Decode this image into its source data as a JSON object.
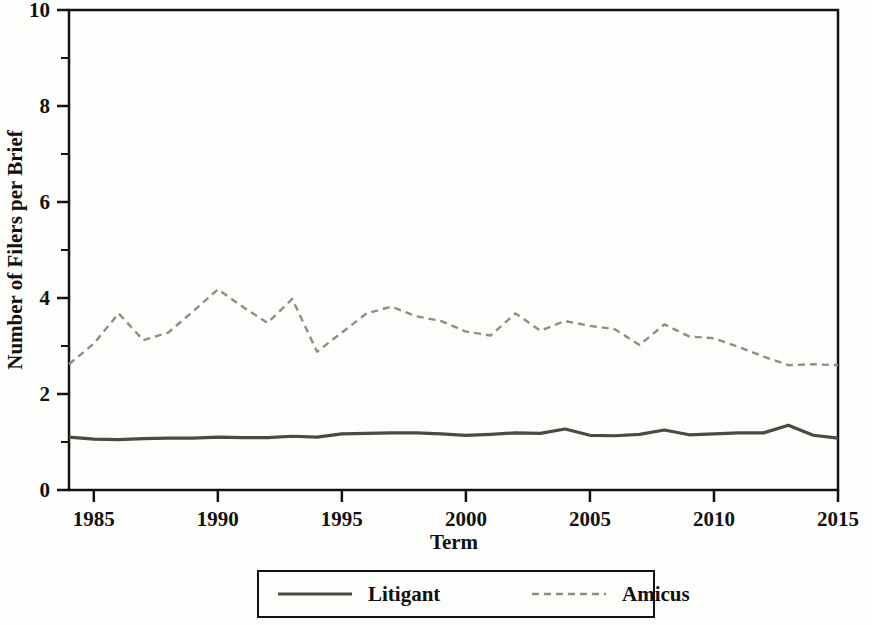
{
  "chart_data": {
    "type": "line",
    "title": "",
    "xlabel": "Term",
    "ylabel": "Number of Filers per Brief",
    "xlim": [
      1984,
      2015
    ],
    "ylim": [
      0,
      10
    ],
    "yticks": [
      0,
      2,
      4,
      6,
      8,
      10
    ],
    "yticks_minor": [
      1,
      3,
      5,
      7,
      9
    ],
    "xticks": [
      1985,
      1990,
      1995,
      2000,
      2005,
      2010,
      2015
    ],
    "grid": false,
    "legend_position": "below-axes",
    "x": [
      1984,
      1985,
      1986,
      1987,
      1988,
      1989,
      1990,
      1991,
      1992,
      1993,
      1994,
      1995,
      1996,
      1997,
      1998,
      1999,
      2000,
      2001,
      2002,
      2003,
      2004,
      2005,
      2006,
      2007,
      2008,
      2009,
      2010,
      2011,
      2012,
      2013,
      2014,
      2015
    ],
    "series": [
      {
        "name": "Litigant",
        "style": "solid",
        "color": "#4a4a42",
        "values": [
          1.1,
          1.06,
          1.05,
          1.07,
          1.08,
          1.08,
          1.1,
          1.09,
          1.09,
          1.12,
          1.1,
          1.17,
          1.18,
          1.19,
          1.19,
          1.17,
          1.14,
          1.16,
          1.19,
          1.18,
          1.27,
          1.14,
          1.13,
          1.16,
          1.25,
          1.15,
          1.17,
          1.19,
          1.19,
          1.35,
          1.14,
          1.08
        ]
      },
      {
        "name": "Amicus",
        "style": "dashed",
        "color": "#8e8e84",
        "values": [
          2.62,
          3.05,
          3.68,
          3.12,
          3.28,
          3.72,
          4.18,
          3.82,
          3.48,
          3.98,
          2.88,
          3.28,
          3.68,
          3.82,
          3.62,
          3.52,
          3.3,
          3.22,
          3.68,
          3.32,
          3.52,
          3.42,
          3.35,
          3.02,
          3.45,
          3.2,
          3.16,
          2.98,
          2.78,
          2.6,
          2.62,
          2.6
        ]
      }
    ]
  },
  "legend": {
    "items": [
      {
        "label": "Litigant",
        "style": "solid",
        "color": "#4a4a42"
      },
      {
        "label": "Amicus",
        "style": "dashed",
        "color": "#8e8e84"
      }
    ]
  },
  "axes": {
    "x_title": "Term",
    "y_title": "Number of Filers per Brief"
  }
}
